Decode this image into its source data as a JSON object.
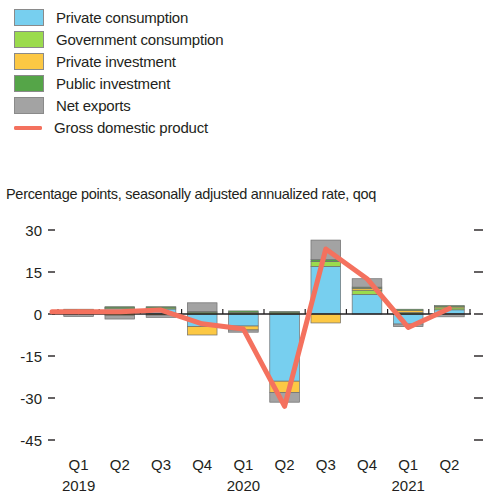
{
  "legend": {
    "items": [
      {
        "label": "Private consumption",
        "color": "#77CFEF",
        "type": "swatch"
      },
      {
        "label": "Government consumption",
        "color": "#9BDB4D",
        "type": "swatch"
      },
      {
        "label": "Private investment",
        "color": "#FCC844",
        "type": "swatch"
      },
      {
        "label": "Public investment",
        "color": "#55A548",
        "type": "swatch"
      },
      {
        "label": "Net exports",
        "color": "#A3A3A3",
        "type": "swatch"
      },
      {
        "label": "Gross domestic product",
        "color": "#F4715E",
        "type": "line"
      }
    ]
  },
  "subtitle": "Percentage points, seasonally adjusted annualized rate, qoq",
  "chart_data": {
    "type": "bar",
    "title": "",
    "subtitle": "Percentage points, seasonally adjusted annualized rate, qoq",
    "xlabel": "",
    "ylabel": "",
    "ylim": [
      -45,
      30
    ],
    "yticks": [
      30,
      15,
      0,
      -15,
      -30,
      -45
    ],
    "ytick_labels": [
      "30",
      "15",
      "0",
      "-15",
      "-30",
      "-45"
    ],
    "grid": false,
    "stacked": true,
    "legend_position": "top-left",
    "categories": [
      "Q1",
      "Q2",
      "Q3",
      "Q4",
      "Q1",
      "Q2",
      "Q3",
      "Q4",
      "Q1",
      "Q2"
    ],
    "year_labels": [
      {
        "label": "2019",
        "category_index": 0
      },
      {
        "label": "2020",
        "category_index": 4
      },
      {
        "label": "2021",
        "category_index": 8
      }
    ],
    "series": [
      {
        "name": "Private consumption",
        "color": "#77CFEF",
        "values": [
          0.6,
          1.9,
          1.8,
          -4.5,
          -4.3,
          -24.0,
          17.0,
          7.0,
          -3.6,
          1.5
        ]
      },
      {
        "name": "Government consumption",
        "color": "#9BDB4D",
        "values": [
          0.3,
          0.4,
          0.4,
          0.5,
          0.6,
          0.6,
          1.8,
          1.5,
          0.6,
          0.7
        ]
      },
      {
        "name": "Private investment",
        "color": "#FCC844",
        "values": [
          0.5,
          -0.6,
          -0.4,
          -3.0,
          -1.4,
          -4.0,
          -3.2,
          0.7,
          0.8,
          0.5
        ]
      },
      {
        "name": "Public investment",
        "color": "#55A548",
        "values": [
          0.3,
          0.3,
          0.4,
          0.4,
          0.5,
          0.3,
          0.6,
          0.4,
          0.3,
          0.3
        ]
      },
      {
        "name": "Net exports",
        "color": "#A3A3A3",
        "values": [
          -0.9,
          -1.2,
          -0.8,
          3.1,
          -0.8,
          -3.5,
          7.0,
          3.0,
          -0.9,
          -1.0
        ]
      }
    ],
    "line_series": {
      "name": "Gross domestic product",
      "color": "#F4715E",
      "values": [
        0.8,
        0.8,
        1.4,
        -3.5,
        -5.4,
        -33.0,
        23.2,
        12.6,
        -4.8,
        2.0
      ]
    }
  }
}
